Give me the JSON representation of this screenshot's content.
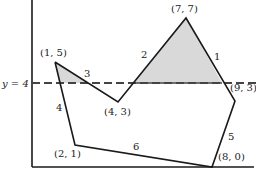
{
  "diagram": {
    "title": "",
    "line_label": "y = 4",
    "shade_color": "#d9d9d9",
    "vertices": [
      {
        "id": "A",
        "label": "(1, 5)"
      },
      {
        "id": "B",
        "label": "(4, 3)"
      },
      {
        "id": "C",
        "label": "(7, 7)"
      },
      {
        "id": "D",
        "label": "(9, 3)"
      },
      {
        "id": "E",
        "label": "(8, 0)"
      },
      {
        "id": "F",
        "label": "(2, 1)"
      }
    ],
    "edges": [
      {
        "number": "1",
        "from": "(7, 7)",
        "to": "(9, 3)"
      },
      {
        "number": "2",
        "from": "(4, 3)",
        "to": "(7, 7)"
      },
      {
        "number": "3",
        "from": "(1, 5)",
        "to": "(4, 3)"
      },
      {
        "number": "4",
        "from": "(1, 5)",
        "to": "(2, 1)"
      },
      {
        "number": "5",
        "from": "(9, 3)",
        "to": "(8, 0)"
      },
      {
        "number": "6",
        "from": "(2, 1)",
        "to": "(8, 0)"
      }
    ]
  }
}
